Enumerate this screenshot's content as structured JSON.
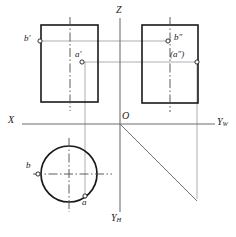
{
  "figure": {
    "type": "descriptive-geometry-projection",
    "background_color": "#ffffff",
    "line_color": "#3a3a3a",
    "object_line_color": "#1a1a1a",
    "thin_line_color": "#8a8a8a",
    "centerline_color": "#555555"
  },
  "axes": {
    "origin_label": "O",
    "x_label": "X",
    "z_label": "Z",
    "yw_label": "Y",
    "yw_sub": "W",
    "yh_label": "Y",
    "yh_sub": "H",
    "origin": {
      "x": 120,
      "y": 124
    },
    "x_axis": {
      "x1": 22,
      "y1": 124,
      "x2": 215,
      "y2": 124
    },
    "z_axis": {
      "x1": 120,
      "y1": 18,
      "x2": 120,
      "y2": 212
    },
    "miter_line": {
      "x1": 120,
      "y1": 124,
      "x2": 196,
      "y2": 199
    }
  },
  "views": {
    "front_view": {
      "name": "V-projection rectangle",
      "rect": {
        "x": 41,
        "y": 25,
        "w": 57,
        "h": 77
      },
      "centerline_x": 70
    },
    "side_view": {
      "name": "W-projection rectangle",
      "rect": {
        "x": 142,
        "y": 25,
        "w": 56,
        "h": 78
      },
      "centerline_x": 170
    },
    "top_view": {
      "name": "H-projection circle",
      "circle": {
        "cx": 69,
        "cy": 174,
        "r": 28
      },
      "centerline_h": {
        "x1": 33,
        "y1": 174,
        "x2": 112,
        "y2": 174
      },
      "centerline_v": {
        "x1": 69,
        "y1": 138,
        "x2": 69,
        "y2": 212
      }
    }
  },
  "points": [
    {
      "id": "b-front",
      "label": "b",
      "prime": "'",
      "parens": false,
      "marker": {
        "x": 40,
        "y": 41
      },
      "label_pos": {
        "x": 25,
        "y": 34
      }
    },
    {
      "id": "a-front",
      "label": "a",
      "prime": "'",
      "parens": false,
      "marker": {
        "x": 82,
        "y": 62
      },
      "label_pos": {
        "x": 75,
        "y": 49
      }
    },
    {
      "id": "b-side",
      "label": "b",
      "prime": "\"",
      "parens": false,
      "marker": {
        "x": 168,
        "y": 41
      },
      "label_pos": {
        "x": 175,
        "y": 33
      }
    },
    {
      "id": "a-side",
      "label": "a",
      "prime": "\"",
      "parens": true,
      "marker": {
        "x": 197,
        "y": 62
      },
      "label_pos": {
        "x": 172,
        "y": 48
      }
    },
    {
      "id": "b-top",
      "label": "b",
      "prime": "",
      "parens": false,
      "marker": {
        "x": 38,
        "y": 174
      },
      "label_pos": {
        "x": 26,
        "y": 161
      }
    },
    {
      "id": "a-top",
      "label": "a",
      "prime": "",
      "parens": false,
      "marker": {
        "x": 85,
        "y": 196
      },
      "label_pos": {
        "x": 80,
        "y": 197
      }
    }
  ],
  "projection_lines": [
    {
      "from": "b-front",
      "to": "b-side",
      "orientation": "horizontal",
      "y": 41
    },
    {
      "from": "a-front",
      "to": "a-side",
      "orientation": "horizontal",
      "y": 62
    },
    {
      "from": "a-front",
      "to": "a-top",
      "orientation": "vertical",
      "x": 85
    },
    {
      "from": "a-side",
      "to": "miter",
      "orientation": "vertical",
      "x": 197
    }
  ],
  "labels": {
    "origin": "O",
    "x": "X",
    "z": "Z",
    "y_w_base": "Y",
    "y_w_sub": "W",
    "y_h_base": "Y",
    "y_h_sub": "H",
    "b_front": "b",
    "a_front": "a",
    "b_side": "b",
    "a_side": "a",
    "b_top": "b",
    "a_top": "a",
    "single_prime": "′",
    "double_prime": "″",
    "paren_open": "(",
    "paren_close": ")"
  }
}
